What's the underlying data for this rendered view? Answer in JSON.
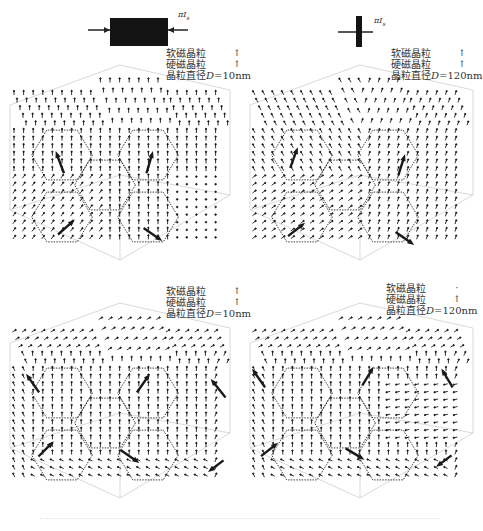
{
  "figure": {
    "field_symbol": "πI",
    "field_symbol_sub": "s",
    "colors": {
      "arrow": "#1a1a1a",
      "grain_edge": "#2a2a2a",
      "axis": "#c8c8c8",
      "bar": "#141414"
    }
  },
  "top_illustrations": [
    {
      "id": "left",
      "shape": "wide-bar",
      "label": "πI",
      "label_sub": "s"
    },
    {
      "id": "right",
      "shape": "cross",
      "label": "πI",
      "label_sub": "s"
    }
  ],
  "panels": [
    {
      "id": "top-left",
      "legend": {
        "soft": "软磁晶粒",
        "hard": "硬磁晶粒",
        "diameter_prefix": "晶粒直径",
        "diameter_var": "D",
        "diameter_value": "=10nm"
      },
      "pattern": "vertical-aligned",
      "big_arrows": [
        [
          62,
          123,
          -0.45,
          -1.2
        ],
        [
          148,
          123,
          0.35,
          -1.2
        ],
        [
          62,
          186,
          0.9,
          -0.8
        ],
        [
          148,
          186,
          1.0,
          0.7
        ]
      ]
    },
    {
      "id": "top-right",
      "legend": {
        "soft": "软磁晶粒",
        "hard": "硬磁晶粒",
        "diameter_prefix": "晶粒直径",
        "diameter_var": "D",
        "diameter_value": "=120nm"
      },
      "pattern": "swirl-tilted",
      "big_arrows": [
        [
          52,
          118,
          0.4,
          -1.1
        ],
        [
          160,
          125,
          0.35,
          -1.1
        ],
        [
          52,
          188,
          0.9,
          -0.7
        ],
        [
          160,
          190,
          1.0,
          0.7
        ]
      ]
    },
    {
      "id": "bottom-left",
      "legend": {
        "soft": "软磁晶粒",
        "hard": "硬磁晶粒",
        "diameter_prefix": "晶粒直径",
        "diameter_var": "D",
        "diameter_value": "=10nm"
      },
      "pattern": "edge-curl",
      "big_arrows": [
        [
          36,
          105,
          -0.7,
          -1.0
        ],
        [
          140,
          105,
          0.7,
          -1.0
        ],
        [
          222,
          110,
          -0.8,
          -1.0
        ],
        [
          42,
          170,
          0.8,
          -0.8
        ],
        [
          125,
          170,
          1.0,
          0.7
        ],
        [
          220,
          180,
          -0.8,
          0.6
        ]
      ]
    },
    {
      "id": "bottom-right",
      "legend": {
        "soft": "软磁晶粒",
        "hard": "硬磁晶粒",
        "diameter_prefix": "晶粒直径",
        "diameter_var": "D",
        "diameter_value": "=120nm"
      },
      "pattern": "edge-curl-strong",
      "big_arrows": [
        [
          22,
          100,
          -0.7,
          -1.0
        ],
        [
          125,
          98,
          0.6,
          -1.0
        ],
        [
          210,
          100,
          -0.6,
          -1.0
        ],
        [
          25,
          170,
          0.9,
          -0.7
        ],
        [
          110,
          168,
          1.0,
          0.6
        ],
        [
          208,
          175,
          -0.8,
          0.6
        ]
      ]
    }
  ],
  "caption": ""
}
